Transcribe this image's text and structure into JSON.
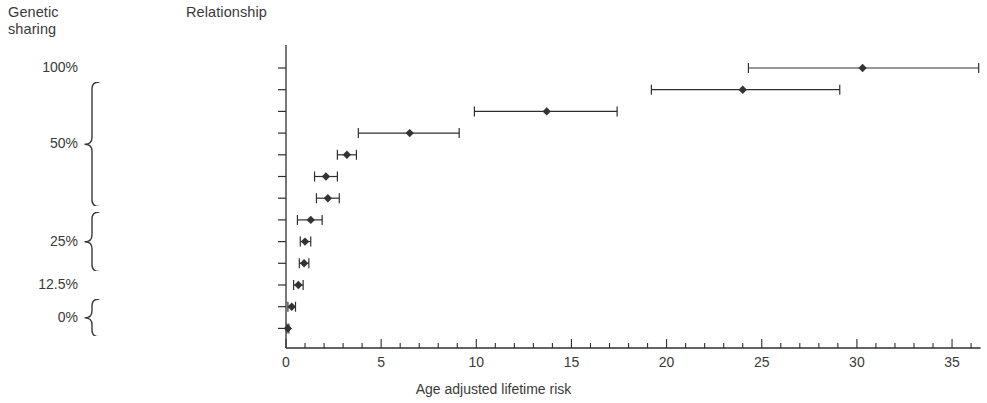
{
  "header": {
    "genetic_sharing": "Genetic\nsharing",
    "relationship": "Relationship"
  },
  "colors": {
    "ink": "#3a3a3a",
    "axis": "#2f2f2f",
    "marker": "#333333",
    "background": "#ffffff"
  },
  "genetic_groups": [
    {
      "label": "100%",
      "rows": [
        0,
        0
      ]
    },
    {
      "label": "50%",
      "rows": [
        1,
        6
      ]
    },
    {
      "label": "25%",
      "rows": [
        7,
        9
      ]
    },
    {
      "label": "12.5%",
      "rows": [
        10,
        10
      ]
    },
    {
      "label": "0%",
      "rows": [
        11,
        12
      ]
    }
  ],
  "chart_data": {
    "type": "scatter",
    "subtype": "forest-plot-with-error-bars",
    "title": "",
    "xlabel": "Age adjusted lifetime risk",
    "ylabel": "Relationship",
    "xlim": [
      0,
      36.5
    ],
    "xticks_major": [
      0,
      5,
      10,
      15,
      20,
      25,
      30,
      35
    ],
    "xticks_major_labels": [
      "0",
      "5",
      "10",
      "15",
      "20",
      "25",
      "30",
      "35"
    ],
    "xtick_minor_step": 1,
    "grid": false,
    "legend": "none",
    "categories": [
      "MZ twin",
      "Sibling, 2 affected parents",
      "Sibling,1 affected parent",
      "DZ twin",
      "Sibling",
      "Parent",
      "Child",
      "Half sibling",
      "Aunt/uncle",
      "Nephew/niece",
      "Cousin",
      "Adoptee",
      "General population"
    ],
    "values": [
      30.3,
      24.0,
      13.7,
      6.5,
      3.2,
      2.1,
      2.2,
      1.3,
      1.0,
      0.95,
      0.65,
      0.3,
      0.1
    ],
    "ci_low": [
      24.3,
      19.2,
      9.9,
      3.8,
      2.7,
      1.5,
      1.6,
      0.6,
      0.75,
      0.7,
      0.4,
      0.1,
      0.05
    ],
    "ci_high": [
      36.4,
      29.1,
      17.4,
      9.1,
      3.7,
      2.7,
      2.8,
      1.9,
      1.3,
      1.2,
      0.9,
      0.5,
      0.15
    ]
  }
}
